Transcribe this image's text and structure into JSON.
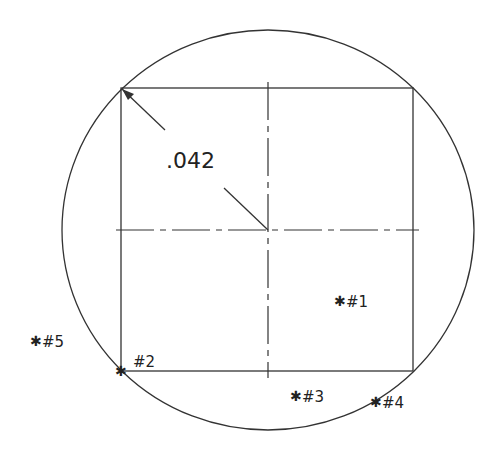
{
  "diagram": {
    "dimension_label": ".042",
    "points": [
      {
        "id": "p1",
        "label": "#1",
        "x": 340,
        "y": 300
      },
      {
        "id": "p2",
        "label": "#2",
        "x": 121,
        "y": 371
      },
      {
        "id": "p3",
        "label": "#3",
        "x": 296,
        "y": 396
      },
      {
        "id": "p4",
        "label": "#4",
        "x": 375,
        "y": 402
      },
      {
        "id": "p5",
        "label": "#5",
        "x": 35,
        "y": 340
      }
    ],
    "marker_glyph": "∗",
    "colors": {
      "line": "#333333",
      "background": "#ffffff"
    }
  }
}
